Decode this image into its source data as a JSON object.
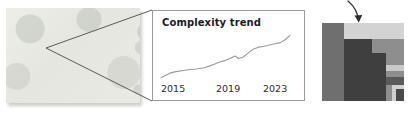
{
  "figure": {
    "name": "magnified-trend-figure",
    "panels": [
      "micrograph",
      "chart-card",
      "pixel-zoom-block"
    ]
  },
  "micrograph": {
    "name": "sample-micrograph",
    "background_color": "#e9e9e4",
    "blobs": [
      {
        "cx": 40,
        "cy": 47,
        "r": 19,
        "color": "#2e2e2e"
      },
      {
        "cx": 100,
        "cy": 38,
        "r": 11,
        "color": "#7b7b7b"
      },
      {
        "cx": 108,
        "cy": 62,
        "r": 11,
        "color": "#3a3a3a"
      },
      {
        "cx": 68,
        "cy": 22,
        "r": 8,
        "color": "#9aa09a"
      },
      {
        "cx": 82,
        "cy": 30,
        "r": 6,
        "color": "#b4b8b2"
      },
      {
        "cx": 70,
        "cy": 40,
        "r": 7,
        "color": "#b0b4ae"
      },
      {
        "cx": 84,
        "cy": 47,
        "r": 6,
        "color": "#a8aca6"
      },
      {
        "cx": 72,
        "cy": 56,
        "r": 5,
        "color": "#b6bab4"
      },
      {
        "cx": 62,
        "cy": 50,
        "r": 4,
        "color": "#bfc3bd"
      },
      {
        "cx": 88,
        "cy": 60,
        "r": 4,
        "color": "#b2b6b0"
      },
      {
        "cx": 78,
        "cy": 65,
        "r": 3,
        "color": "#c2c6c0"
      },
      {
        "cx": 64,
        "cy": 66,
        "r": 6,
        "color": "#9ba19b"
      },
      {
        "cx": 92,
        "cy": 73,
        "r": 8,
        "color": "#8d938d"
      },
      {
        "cx": 57,
        "cy": 34,
        "r": 5,
        "color": "#c0c4be"
      },
      {
        "cx": 18,
        "cy": 18,
        "r": 7,
        "color": "#ccd0ca"
      },
      {
        "cx": 14,
        "cy": 30,
        "r": 5,
        "color": "#d2d6d0"
      },
      {
        "cx": 26,
        "cy": 28,
        "r": 4,
        "color": "#ced2cc"
      },
      {
        "cx": 22,
        "cy": 74,
        "r": 6,
        "color": "#ccd0ca"
      },
      {
        "cx": 12,
        "cy": 62,
        "r": 4,
        "color": "#d0d4ce"
      },
      {
        "cx": 118,
        "cy": 20,
        "r": 6,
        "color": "#c6cac4"
      },
      {
        "cx": 126,
        "cy": 80,
        "r": 5,
        "color": "#c8ccc6"
      }
    ]
  },
  "callout": {
    "name": "magnification-callout",
    "line_color": "#4a4a4a"
  },
  "chart_data": {
    "type": "line",
    "title": "Complexity trend",
    "xlabel": "",
    "ylabel": "",
    "grid": false,
    "legend": null,
    "line_color": "#9a9a9a",
    "xticklabels": [
      "2015",
      "2019",
      "2023"
    ],
    "xlim": [
      2015,
      2023
    ],
    "ylim": [
      0,
      1
    ],
    "x": [
      2015.0,
      2015.3,
      2015.6,
      2016.0,
      2016.4,
      2016.8,
      2017.2,
      2017.6,
      2018.0,
      2018.3,
      2018.6,
      2019.0,
      2019.2,
      2019.4,
      2019.6,
      2019.8,
      2020.1,
      2020.4,
      2020.7,
      2021.0,
      2021.3,
      2021.6,
      2022.0,
      2022.4,
      2022.7,
      2023.0
    ],
    "y": [
      0.07,
      0.12,
      0.17,
      0.2,
      0.22,
      0.24,
      0.25,
      0.27,
      0.31,
      0.35,
      0.39,
      0.43,
      0.46,
      0.49,
      0.52,
      0.47,
      0.5,
      0.58,
      0.66,
      0.7,
      0.72,
      0.74,
      0.77,
      0.8,
      0.86,
      0.95
    ]
  },
  "zoom_arrow": {
    "name": "zoom-arrow",
    "direction": "down",
    "color": "#2b2b2b"
  },
  "pixel_block": {
    "name": "pixelated-zoom-crop",
    "description": "heavily magnified pixel crop",
    "tiles": [
      {
        "x": 0,
        "y": 0,
        "w": 22,
        "h": 78,
        "color": "#6f6f6f"
      },
      {
        "x": 22,
        "y": 0,
        "w": 60,
        "h": 16,
        "color": "#d3d3d3"
      },
      {
        "x": 22,
        "y": 16,
        "w": 60,
        "h": 62,
        "color": "#8e8e8e"
      },
      {
        "x": 22,
        "y": 16,
        "w": 28,
        "h": 62,
        "color": "#3f3f3f"
      },
      {
        "x": 50,
        "y": 30,
        "w": 14,
        "h": 48,
        "color": "#3f3f3f"
      },
      {
        "x": 64,
        "y": 42,
        "w": 18,
        "h": 6,
        "color": "#c9c9c9"
      },
      {
        "x": 64,
        "y": 48,
        "w": 18,
        "h": 6,
        "color": "#8e8e8e"
      },
      {
        "x": 64,
        "y": 54,
        "w": 18,
        "h": 8,
        "color": "#5a5a5a"
      },
      {
        "x": 70,
        "y": 62,
        "w": 12,
        "h": 16,
        "color": "#d0d0d0"
      },
      {
        "x": 74,
        "y": 66,
        "w": 8,
        "h": 12,
        "color": "#4a4a4a"
      }
    ]
  }
}
